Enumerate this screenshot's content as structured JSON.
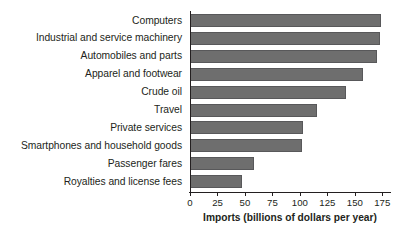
{
  "chart_data": {
    "type": "bar",
    "orientation": "horizontal",
    "title": "",
    "xlabel": "Imports (billions of dollars per year)",
    "ylabel": "",
    "xlim": [
      0,
      182
    ],
    "xticks": [
      0,
      25,
      50,
      75,
      100,
      125,
      150,
      175
    ],
    "xtick_labels": [
      "0",
      "25",
      "50",
      "75",
      "100",
      "125",
      "150",
      "175"
    ],
    "grid": false,
    "legend": false,
    "bar_color": "#6e6e6e",
    "axis_color": "#231f20",
    "categories": [
      "Computers",
      "Industrial and service machinery",
      "Automobiles and parts",
      "Apparel and footwear",
      "Crude oil",
      "Travel",
      "Private services",
      "Smartphones and household goods",
      "Passenger fares",
      "Royalties and license fees"
    ],
    "values": [
      174,
      173,
      170,
      157,
      142,
      116,
      103,
      102,
      58,
      47
    ]
  }
}
